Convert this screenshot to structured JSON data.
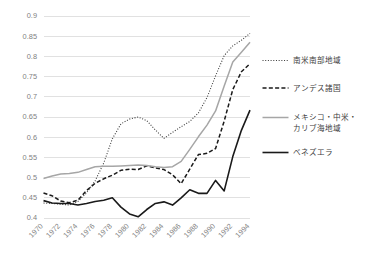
{
  "chart_data": {
    "type": "line",
    "title": "",
    "subtitle": "",
    "xlabel": "",
    "ylabel": "",
    "xlim": [
      1970,
      1994
    ],
    "ylim": [
      0.4,
      0.9
    ],
    "grid": "horizontal",
    "legend_position": "right",
    "x": [
      1970,
      1971,
      1972,
      1973,
      1974,
      1975,
      1976,
      1977,
      1978,
      1979,
      1980,
      1981,
      1982,
      1983,
      1984,
      1985,
      1986,
      1987,
      1988,
      1989,
      1990,
      1991,
      1992,
      1993,
      1994
    ],
    "y_ticks": [
      0.4,
      0.45,
      0.5,
      0.55,
      0.6,
      0.65,
      0.7,
      0.75,
      0.8,
      0.85,
      0.9
    ],
    "y_tick_labels": [
      "0.4",
      "0.45",
      "0.5",
      "0.55",
      "0.6",
      "0.65",
      "0.7",
      "0.75",
      "0.8",
      "0.85",
      "0.9"
    ],
    "x_ticks": [
      1970,
      1972,
      1974,
      1976,
      1978,
      1980,
      1982,
      1984,
      1986,
      1988,
      1990,
      1992,
      1994
    ],
    "x_tick_labels": [
      "1970",
      "1972",
      "1974",
      "1976",
      "1978",
      "1980",
      "1982",
      "1984",
      "1986",
      "1988",
      "1990",
      "1992",
      "1994"
    ],
    "series": [
      {
        "name": "南米南部地域",
        "style": "dotted",
        "color": "#404040",
        "width": 1.1,
        "values": [
          0.437,
          0.436,
          0.434,
          0.432,
          0.441,
          0.462,
          0.492,
          0.536,
          0.596,
          0.633,
          0.645,
          0.65,
          0.641,
          0.618,
          0.597,
          0.612,
          0.626,
          0.639,
          0.66,
          0.698,
          0.752,
          0.802,
          0.826,
          0.84,
          0.857
        ]
      },
      {
        "name": "アンデス諸国",
        "style": "dashed",
        "color": "#1a1a1a",
        "width": 1.5,
        "values": [
          0.462,
          0.455,
          0.442,
          0.438,
          0.444,
          0.468,
          0.486,
          0.497,
          0.506,
          0.518,
          0.521,
          0.52,
          0.529,
          0.524,
          0.52,
          0.507,
          0.485,
          0.521,
          0.557,
          0.56,
          0.572,
          0.64,
          0.718,
          0.762,
          0.782
        ]
      },
      {
        "name": "メキシコ・中米・カリブ海地域",
        "style": "solid",
        "color": "#a6a6a6",
        "width": 1.5,
        "values": [
          0.498,
          0.504,
          0.509,
          0.51,
          0.513,
          0.52,
          0.527,
          0.528,
          0.528,
          0.529,
          0.53,
          0.531,
          0.53,
          0.527,
          0.525,
          0.527,
          0.54,
          0.57,
          0.601,
          0.63,
          0.665,
          0.727,
          0.786,
          0.81,
          0.835
        ]
      },
      {
        "name": "ベネズエラ",
        "style": "solid",
        "color": "#1a1a1a",
        "width": 1.6,
        "values": [
          0.443,
          0.437,
          0.436,
          0.436,
          0.432,
          0.436,
          0.441,
          0.444,
          0.45,
          0.427,
          0.41,
          0.403,
          0.421,
          0.436,
          0.44,
          0.432,
          0.45,
          0.47,
          0.461,
          0.461,
          0.493,
          0.467,
          0.552,
          0.617,
          0.667
        ]
      }
    ]
  },
  "legend": {
    "items": [
      {
        "label": "南米南部地域"
      },
      {
        "label": "アンデス諸国"
      },
      {
        "label": "メキシコ・中米・",
        "label2": "カリブ海地域"
      },
      {
        "label": "ベネズエラ"
      }
    ]
  }
}
